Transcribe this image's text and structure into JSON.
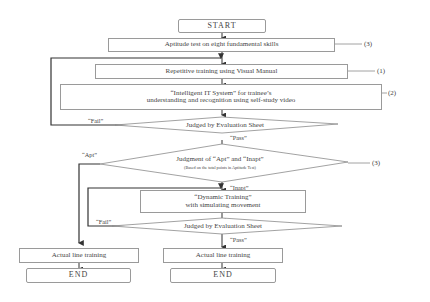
{
  "flowchart": {
    "start": "START",
    "aptitude_test": "Aptitude test on eight fundamental skills",
    "repetitive_training": "Repetitive training using Visual Manual",
    "it_system_line1": "“Intelligent IT System” for trainee’s",
    "it_system_line2": "understanding and recognition using self-study video",
    "judged_1": "Judged by Evaluation Sheet",
    "fail_1": "“Fail”",
    "pass_1": "“Pass”",
    "judgment_line1": "Judgment of “Apt” and “Inapt”",
    "judgment_line2": "(Based on the total points in Aptitude Test)",
    "apt": "“Apt”",
    "inapt": "“Inapt”",
    "dynamic_line1": "“Dynamic Training”",
    "dynamic_line2": "with simulating movement",
    "judged_2": "Judged by Evaluation Sheet",
    "fail_2": "“Fail”",
    "pass_2": "“Pass”",
    "actual_left": "Actual line training",
    "actual_right": "Actual line training",
    "end_left": "END",
    "end_right": "END",
    "ref_aptitude": "(3)",
    "ref_repetitive": "(1)",
    "ref_it_system": "(2)",
    "ref_judgment": "(3)"
  }
}
